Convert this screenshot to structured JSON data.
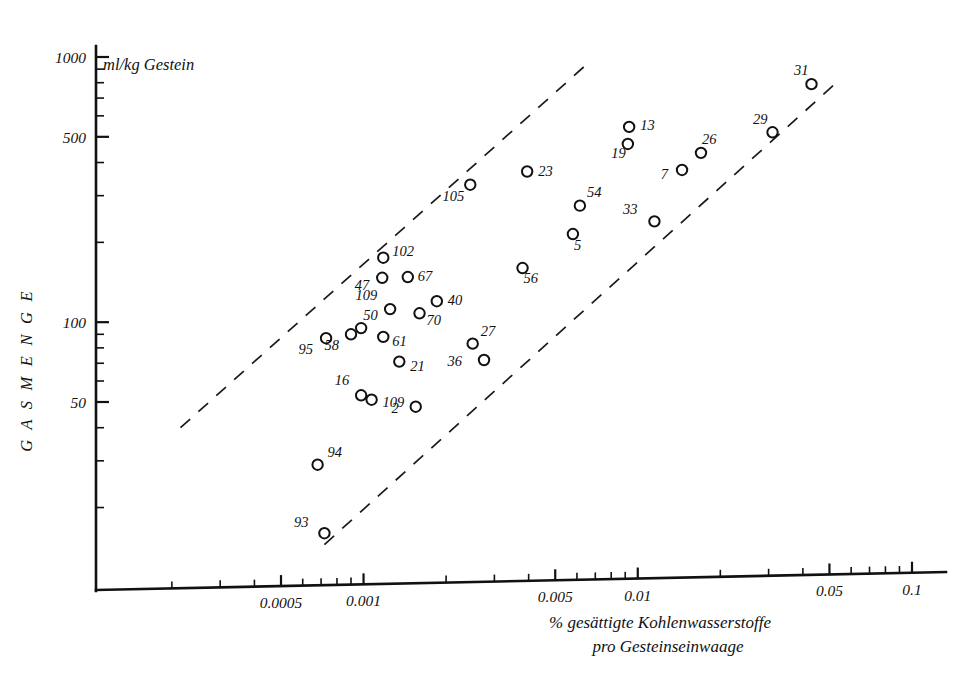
{
  "chart_data": {
    "type": "scatter",
    "title": "",
    "subtitle": "",
    "xlabel": "% gesättigte Kohlenwasserstoffe pro Gesteinseinwaage",
    "xlabel_line1": "% gesättigte Kohlenwasserstoffe",
    "xlabel_line2": "pro Gesteinseinwaage",
    "ylabel": "GASMENGE",
    "y_unit_caption": "ml/kg Gestein",
    "x_scale": "log",
    "y_scale": "log",
    "xlim": [
      0.00018,
      0.16
    ],
    "ylim": [
      11,
      1150
    ],
    "grid": false,
    "legend": "none",
    "x_tick_labels": [
      "0.0005",
      "0.001",
      "0.005",
      "0.01",
      "0.05",
      "0.1"
    ],
    "x_tick_values": [
      0.0005,
      0.001,
      0.005,
      0.01,
      0.05,
      0.1
    ],
    "y_tick_labels": [
      "1000",
      "500",
      "100",
      "50"
    ],
    "y_tick_values": [
      1000,
      500,
      100,
      50
    ],
    "point_label_key": "sample number",
    "points": [
      {
        "label": "93",
        "x": 0.00072,
        "y": 16
      },
      {
        "label": "94",
        "x": 0.00068,
        "y": 29
      },
      {
        "label": "2",
        "x": 0.00155,
        "y": 48
      },
      {
        "label": "16",
        "x": 0.00098,
        "y": 53
      },
      {
        "label": "109",
        "x": 0.00107,
        "y": 51
      },
      {
        "label": "21",
        "x": 0.00135,
        "y": 71
      },
      {
        "label": "36",
        "x": 0.00275,
        "y": 72
      },
      {
        "label": "95",
        "x": 0.00073,
        "y": 87
      },
      {
        "label": "58",
        "x": 0.0009,
        "y": 90
      },
      {
        "label": "50",
        "x": 0.00098,
        "y": 95
      },
      {
        "label": "61",
        "x": 0.00118,
        "y": 88
      },
      {
        "label": "27",
        "x": 0.0025,
        "y": 83
      },
      {
        "label": "70",
        "x": 0.0016,
        "y": 108
      },
      {
        "label": "109",
        "x": 0.00125,
        "y": 112
      },
      {
        "label": "40",
        "x": 0.00185,
        "y": 120
      },
      {
        "label": "47",
        "x": 0.00117,
        "y": 147
      },
      {
        "label": "67",
        "x": 0.00145,
        "y": 148
      },
      {
        "label": "102",
        "x": 0.00118,
        "y": 175
      },
      {
        "label": "56",
        "x": 0.0038,
        "y": 160
      },
      {
        "label": "5",
        "x": 0.0058,
        "y": 215
      },
      {
        "label": "54",
        "x": 0.00615,
        "y": 275
      },
      {
        "label": "33",
        "x": 0.0115,
        "y": 240
      },
      {
        "label": "105",
        "x": 0.00245,
        "y": 330
      },
      {
        "label": "23",
        "x": 0.00395,
        "y": 370
      },
      {
        "label": "7",
        "x": 0.0145,
        "y": 375
      },
      {
        "label": "26",
        "x": 0.017,
        "y": 435
      },
      {
        "label": "19",
        "x": 0.0092,
        "y": 470
      },
      {
        "label": "13",
        "x": 0.0093,
        "y": 545
      },
      {
        "label": "29",
        "x": 0.031,
        "y": 520
      },
      {
        "label": "31",
        "x": 0.043,
        "y": 790
      }
    ],
    "trend_lines": [
      {
        "name": "upper-boundary",
        "style": "dashed",
        "x_start": 0.000215,
        "y_start": 40,
        "x_end": 0.0066,
        "y_end": 950
      },
      {
        "name": "lower-boundary",
        "style": "dashed",
        "x_start": 0.00072,
        "y_start": 14.5,
        "x_end": 0.053,
        "y_end": 800
      }
    ]
  }
}
